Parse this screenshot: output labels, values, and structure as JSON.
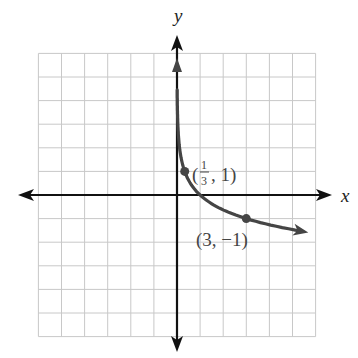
{
  "chart_data": {
    "type": "line",
    "title": "",
    "xlabel": "x",
    "ylabel": "y",
    "xlim": [
      -6,
      6
    ],
    "ylim": [
      -6,
      6
    ],
    "grid": true,
    "function": "y = -log_3(x)",
    "series": [
      {
        "name": "curve",
        "x": [
          0.02,
          0.05,
          0.111,
          0.333,
          0.5,
          1,
          2,
          3,
          4,
          5.5
        ],
        "y": [
          3.56,
          2.73,
          2.0,
          1.0,
          0.63,
          0,
          -0.63,
          -1,
          -1.26,
          -1.55
        ]
      }
    ],
    "labeled_points": [
      {
        "x": 0.3333,
        "y": 1,
        "label_paren_open": "(",
        "label_num": "1",
        "label_den": "3",
        "label_rest": ", 1)"
      },
      {
        "x": 3,
        "y": -1,
        "label": "(3, −1)"
      }
    ]
  },
  "axes": {
    "x_label": "x",
    "y_label": "y"
  },
  "colors": {
    "curve": "#454545",
    "grid": "#c8c8c8",
    "axis": "#111111"
  }
}
